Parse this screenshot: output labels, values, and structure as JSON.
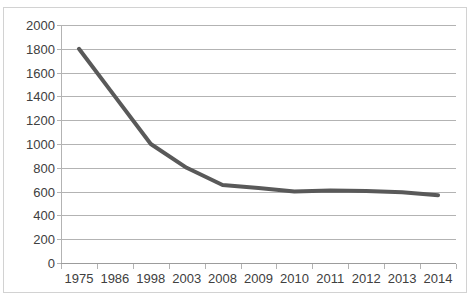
{
  "chart_data": {
    "type": "line",
    "title": "",
    "subtitle": "",
    "xlabel": "",
    "ylabel": "",
    "categories": [
      "1975",
      "1986",
      "1998",
      "2003",
      "2008",
      "2009",
      "2010",
      "2011",
      "2012",
      "2013",
      "2014"
    ],
    "values": [
      1800,
      1400,
      1000,
      800,
      655,
      630,
      600,
      610,
      605,
      595,
      570
    ],
    "series": [
      {
        "name": "Series 1",
        "values": [
          1800,
          1400,
          1000,
          800,
          655,
          630,
          600,
          610,
          605,
          595,
          570
        ],
        "color": "#595959"
      }
    ],
    "ylim": [
      0,
      2000
    ],
    "y_ticks": [
      0,
      200,
      400,
      600,
      800,
      1000,
      1200,
      1400,
      1600,
      1800,
      2000
    ],
    "y_tick_labels": [
      "0",
      "200",
      "400",
      "600",
      "800",
      "1000",
      "1200",
      "1400",
      "1600",
      "1800",
      "2000"
    ],
    "grid": true,
    "grid_axis": "y",
    "legend": false,
    "legend_position": "none",
    "markers": false,
    "line_width": 4
  },
  "style": {
    "line_color": "#595959",
    "gridline_color": "#b3b3b3",
    "axis_color": "#b3b3b3",
    "tick_label_color": "#404040",
    "frame_border_color": "#d2d2d2",
    "plot_background": "#ffffff"
  }
}
